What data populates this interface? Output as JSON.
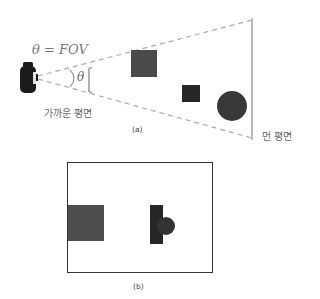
{
  "diagram": {
    "panel_a": {
      "caption": "(a)",
      "fov_label": "θ = FOV",
      "angle_label": "θ",
      "near_plane_label": "가까운 평면",
      "far_plane_label": "먼 평면",
      "camera": {
        "x": 20,
        "y": 62,
        "w": 17,
        "h": 31
      },
      "frustum": {
        "apex": [
          38,
          77
        ],
        "far_top": [
          252,
          20
        ],
        "far_bottom": [
          252,
          138
        ]
      },
      "near_plane": {
        "x": 89,
        "y1": 68,
        "y2": 92
      },
      "far_plane": {
        "x": 252,
        "y1": 18,
        "y2": 140
      },
      "objects": [
        {
          "type": "square",
          "x": 131,
          "y": 50,
          "w": 26,
          "h": 27,
          "color": "#4a4a4a"
        },
        {
          "type": "square",
          "x": 182,
          "y": 85,
          "w": 18,
          "h": 17,
          "color": "#262626"
        },
        {
          "type": "circle",
          "cx": 232,
          "cy": 106,
          "r": 15,
          "color": "#383838"
        }
      ]
    },
    "panel_b": {
      "caption": "(b)",
      "frame": {
        "x": 67,
        "y": 162,
        "w": 146,
        "h": 111
      },
      "objects": [
        {
          "type": "square",
          "x": 68,
          "y": 205,
          "w": 36,
          "h": 36,
          "color": "#4d4d4d"
        },
        {
          "type": "rect",
          "x": 150,
          "y": 205,
          "w": 13,
          "h": 39,
          "color": "#262626"
        },
        {
          "type": "circle",
          "cx": 166,
          "cy": 226,
          "r": 9,
          "color": "#333333"
        }
      ]
    },
    "colors": {
      "dash": "#aaaaaa",
      "plane_line": "#999999",
      "frame": "#333333",
      "camera": "#1a1a1a"
    }
  }
}
